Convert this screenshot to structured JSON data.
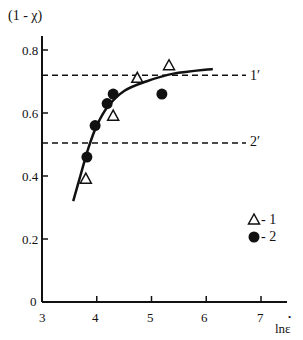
{
  "chart_data": {
    "type": "scatter",
    "title": "",
    "xlabel": "lnε̇",
    "ylabel": "(1 - χ)",
    "xlim": [
      3,
      7.5
    ],
    "ylim": [
      0,
      0.85
    ],
    "x_ticks": [
      "3",
      "4",
      "5",
      "6",
      "7"
    ],
    "y_ticks": [
      "0",
      "0.2",
      "0.4",
      "0.6",
      "0.8"
    ],
    "grid": false,
    "legend_position": "lower right",
    "series": [
      {
        "name": "1",
        "marker": "open-triangle",
        "points": [
          [
            3.8,
            0.39
          ],
          [
            4.3,
            0.59
          ],
          [
            4.74,
            0.71
          ],
          [
            5.32,
            0.75
          ]
        ]
      },
      {
        "name": "2",
        "marker": "filled-circle",
        "points": [
          [
            3.82,
            0.46
          ],
          [
            3.97,
            0.56
          ],
          [
            4.19,
            0.63
          ],
          [
            4.3,
            0.66
          ],
          [
            5.19,
            0.66
          ]
        ]
      }
    ],
    "fit_curve": {
      "style": "solid",
      "points": [
        [
          3.57,
          0.32
        ],
        [
          3.7,
          0.4
        ],
        [
          3.85,
          0.49
        ],
        [
          4.0,
          0.56
        ],
        [
          4.2,
          0.62
        ],
        [
          4.5,
          0.67
        ],
        [
          4.9,
          0.7
        ],
        [
          5.4,
          0.725
        ],
        [
          6.12,
          0.74
        ]
      ]
    },
    "reference_lines": [
      {
        "label": "1′",
        "y": 0.72,
        "style": "dashed"
      },
      {
        "label": "2′",
        "y": 0.505,
        "style": "dashed"
      }
    ]
  },
  "axis": {
    "ylabel": "(1 - χ)",
    "xlabel": "lnε",
    "xlabel_dot": "•",
    "x_ticks": [
      "3",
      "4",
      "5",
      "6",
      "7"
    ],
    "y_ticks": [
      "0",
      "0.2",
      "0.4",
      "0.6",
      "0.8"
    ]
  },
  "references": {
    "line1": "1′",
    "line2": "2′"
  },
  "legend": {
    "item1": "- 1",
    "item2": "- 2"
  }
}
